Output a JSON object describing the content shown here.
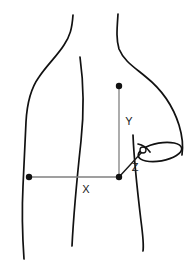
{
  "figure": {
    "type": "anatomical-measurement-diagram",
    "background_color": "#ffffff",
    "outline_color": "#111111",
    "measure_line_color": "#808080",
    "marker_color": "#111111",
    "canvas": {
      "width": 196,
      "height": 280
    }
  },
  "labels": {
    "x": "X",
    "y": "Y",
    "z": "Z"
  },
  "measurements": [
    {
      "id": "x",
      "label": "X",
      "orientation": "horizontal",
      "from_point": "left-flank-marker",
      "to_point": "mid-back-marker",
      "label_position": {
        "x": 86,
        "y": 193
      }
    },
    {
      "id": "y",
      "label": "Y",
      "orientation": "vertical",
      "from_point": "upper-back-marker",
      "to_point": "mid-back-marker",
      "label_position": {
        "x": 129,
        "y": 125
      }
    },
    {
      "id": "z",
      "label": "Z",
      "orientation": "diagonal",
      "from_point": "mid-back-marker",
      "to_point": "axilla-marker",
      "label_position": {
        "x": 135,
        "y": 171
      }
    }
  ],
  "markers": [
    {
      "id": "upper-back-marker",
      "style": "filled-dot",
      "x": 119,
      "y": 86,
      "r": 3.2
    },
    {
      "id": "mid-back-marker",
      "style": "filled-dot",
      "x": 119,
      "y": 177,
      "r": 3.2
    },
    {
      "id": "left-flank-marker",
      "style": "filled-dot",
      "x": 29,
      "y": 177,
      "r": 3.2
    },
    {
      "id": "axilla-marker",
      "style": "open-circle",
      "x": 143,
      "y": 150,
      "r": 3.0
    }
  ],
  "body_outline": {
    "left_shoulder_arm": "M 24,259 C 22,228 22,206 23,186 C 24,163 25,140 26,122 C 27,104 30,88 38,76 C 46,64 56,56 64,45 C 70,37 72,30 73,16",
    "spine_center_line": "M 80,57 C 84,85 84,112 81,140 C 78,168 74,205 72,246",
    "right_shoulder_top": "M 118,14 C 117,28 116,38 119,48 C 123,60 133,66 145,76 C 160,88 173,105 179,124 C 183,137 183,147 182,154",
    "right_flank_line": "M 133,135 C 134,160 138,195 141,220 C 143,235 144,243 143,250",
    "arm_cut_ellipse": {
      "cx": 160,
      "cy": 151,
      "rx": 22,
      "ry": 9,
      "rotation": -9
    },
    "arm_inner_edge": "M 139,140 C 145,143 150,147 152,152"
  }
}
